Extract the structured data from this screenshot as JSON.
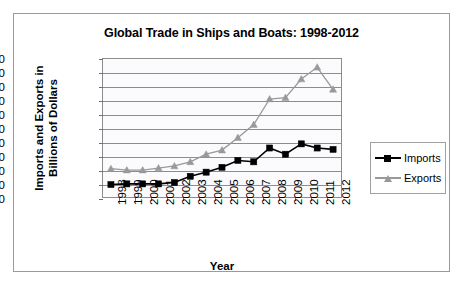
{
  "chart_data": {
    "type": "line",
    "title": "Global Trade in Ships and Boats: 1998-2012",
    "xlabel": "Year",
    "ylabel": "Imports and Exports in Billions of Dollars",
    "ylabel_line1": "Imports and Exports in",
    "ylabel_line2": "Billions of Dollars",
    "categories": [
      "1998",
      "1999",
      "2000",
      "2001",
      "2002",
      "2003",
      "2004",
      "2005",
      "2006",
      "2007",
      "2008",
      "2009",
      "2010",
      "2011",
      "2012"
    ],
    "ylim": [
      0,
      200
    ],
    "ytick_step": 20,
    "yticks": [
      0,
      20,
      40,
      60,
      80,
      100,
      120,
      140,
      160,
      180,
      200
    ],
    "grid": true,
    "legend_position": "right",
    "series": [
      {
        "name": "Imports",
        "color": "#000000",
        "marker": "square",
        "values": [
          18,
          19,
          19,
          19,
          21,
          30,
          36,
          43,
          53,
          51,
          71,
          62,
          77,
          71,
          69
        ]
      },
      {
        "name": "Exports",
        "color": "#999999",
        "marker": "triangle",
        "values": [
          41,
          39,
          39,
          42,
          45,
          51,
          62,
          68,
          86,
          105,
          142,
          144,
          171,
          188,
          156
        ]
      }
    ]
  },
  "legend": {
    "entries": [
      {
        "label": "Imports"
      },
      {
        "label": "Exports"
      }
    ]
  }
}
